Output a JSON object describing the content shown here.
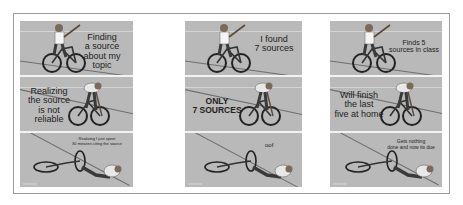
{
  "meme": {
    "template": "bike-stick-fall",
    "panels": [
      {
        "rows": [
          {
            "caption": "Finding a source about my topic",
            "lines": [
              "Finding",
              "a source",
              "about my topic"
            ]
          },
          {
            "caption": "Realizing the source is not reliable",
            "lines": [
              "Realizing",
              "the source",
              "is not reliable"
            ]
          },
          {
            "caption": "Realizing I just spent 30 minutes citing the source",
            "lines": [
              "Realizing I just spent",
              "30 minutes citing the source"
            ]
          }
        ]
      },
      {
        "rows": [
          {
            "caption": "I found 7 sources",
            "lines": [
              "I found",
              "7 sources"
            ]
          },
          {
            "caption": "ONLY 7 SOURCES",
            "lines": [
              "ONLY",
              "7 SOURCES"
            ]
          },
          {
            "caption": "oof",
            "lines": [
              "oof"
            ]
          }
        ]
      },
      {
        "rows": [
          {
            "caption": "Finds 5 sources in class",
            "lines": [
              "Finds 5",
              "sources in class"
            ]
          },
          {
            "caption": "Will finish the last five at home",
            "lines": [
              "Will finish",
              "the last",
              "five at home"
            ]
          },
          {
            "caption": "Gets nothing done and now its due",
            "lines": [
              "Gets nothing",
              "done and now its due"
            ]
          }
        ]
      }
    ]
  },
  "colors": {
    "panel_bg": "#b9b9b9",
    "road_line": "#6e6e6e",
    "frame_border": "#9a9a9a",
    "text": "#222222"
  }
}
